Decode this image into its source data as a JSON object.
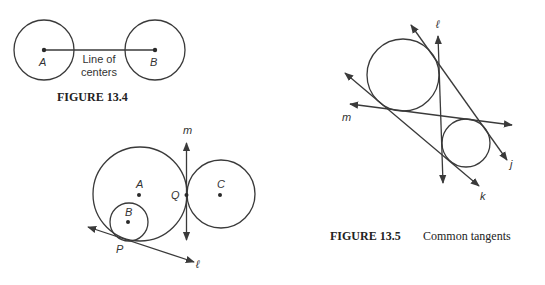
{
  "figure_13_4": {
    "caption": "FIGURE 13.4",
    "labels": {
      "A": "A",
      "B": "B",
      "line_line1": "Line of",
      "line_line2": "centers"
    }
  },
  "figure_13_4b": {
    "labels": {
      "m": "m",
      "A": "A",
      "B": "B",
      "C": "C",
      "Q": "Q",
      "P": "P",
      "l": "ℓ"
    }
  },
  "figure_13_5": {
    "caption_bold": "FIGURE 13.5",
    "caption_text": "Common tangents",
    "labels": {
      "l": "ℓ",
      "m": "m",
      "j": "j",
      "k": "k"
    }
  }
}
